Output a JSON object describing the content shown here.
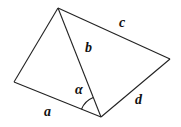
{
  "diagram": {
    "type": "geometry",
    "vertices": {
      "top": [
        58,
        8
      ],
      "left": [
        14,
        82
      ],
      "bottom": [
        101,
        117
      ],
      "right": [
        170,
        59
      ]
    },
    "labels": {
      "a": "a",
      "b": "b",
      "c": "c",
      "d": "d",
      "alpha": "α"
    },
    "stroke_color": "#222222"
  }
}
